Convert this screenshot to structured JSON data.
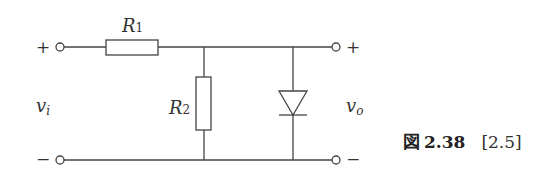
{
  "diagram": {
    "type": "circuit",
    "components": {
      "r1": {
        "label": "R",
        "sub": "1"
      },
      "r2": {
        "label": "R",
        "sub": "2"
      },
      "diode": {
        "label": ""
      }
    },
    "terminals": {
      "input_plus": "+",
      "input_minus": "−",
      "output_plus": "+",
      "output_minus": "−"
    },
    "voltages": {
      "vi": {
        "label": "v",
        "sub": "i"
      },
      "vo": {
        "label": "v",
        "sub": "o"
      }
    }
  },
  "caption": {
    "fig_char": "図",
    "fig_number": "2.38",
    "reference": "[2.5]"
  },
  "colors": {
    "line": "#444444",
    "background": "#ffffff"
  }
}
